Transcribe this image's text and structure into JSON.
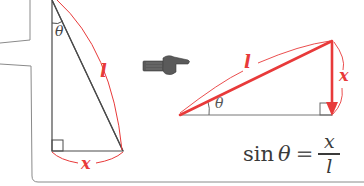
{
  "colors": {
    "accent_red": "#e83a3a",
    "line_gray": "#4a4a4a",
    "outline_gray": "#8a8a8a",
    "hand_gray": "#5a5a5a"
  },
  "left_triangle": {
    "angle_label": "θ",
    "hypotenuse_label": "l",
    "base_label": "x"
  },
  "pointer": {
    "icon": "pointing-hand-icon"
  },
  "right_triangle": {
    "angle_label": "θ",
    "hypotenuse_label": "l",
    "side_label": "x"
  },
  "formula": {
    "function": "sin",
    "variable": "θ",
    "equals": "=",
    "numerator": "x",
    "denominator": "l"
  }
}
